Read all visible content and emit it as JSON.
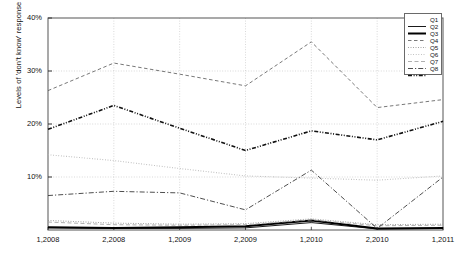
{
  "chart_data": {
    "type": "line",
    "title": "",
    "xlabel": "",
    "ylabel": "Levels of 'don't know' response",
    "categories": [
      "1,2008",
      "2,2008",
      "1,2009",
      "2,2009",
      "1,2010",
      "2,2010",
      "1,2011"
    ],
    "ylim": [
      0,
      40
    ],
    "yticks": [
      0,
      10,
      20,
      30,
      40
    ],
    "ytick_labels": [
      "",
      "10%",
      "20%",
      "30%",
      "40%"
    ],
    "grid": true,
    "legend_position": "top-right",
    "series": [
      {
        "name": "Q1",
        "style": "solid-thin",
        "color": "#000000",
        "values": [
          0.4,
          0.3,
          0.3,
          0.4,
          1.4,
          0.2,
          0.3
        ]
      },
      {
        "name": "Q2",
        "style": "solid-thick",
        "color": "#000000",
        "values": [
          0.5,
          0.4,
          0.5,
          0.7,
          1.8,
          0.3,
          0.4
        ]
      },
      {
        "name": "Q3",
        "style": "dashed",
        "color": "#555555",
        "values": [
          26.3,
          31.5,
          29.4,
          27.2,
          35.5,
          23.1,
          24.6
        ]
      },
      {
        "name": "Q4",
        "style": "dotted-fine",
        "color": "#8a8a8a",
        "values": [
          1.8,
          1.3,
          1.1,
          1.2,
          2.1,
          1.0,
          1.1
        ]
      },
      {
        "name": "Q5",
        "style": "dotted-light",
        "color": "#b5b5b5",
        "values": [
          14.2,
          13.1,
          11.6,
          10.2,
          9.8,
          9.4,
          10.2
        ]
      },
      {
        "name": "Q6",
        "style": "dashed-long",
        "color": "#9a9a9a",
        "values": [
          1.5,
          1.0,
          0.9,
          1.0,
          1.9,
          0.8,
          0.9
        ]
      },
      {
        "name": "Q7",
        "style": "dashdot",
        "color": "#3a3a3a",
        "values": [
          6.5,
          7.3,
          7.0,
          3.8,
          11.3,
          0.3,
          10.0
        ]
      },
      {
        "name": "Q8",
        "style": "dashdotdot",
        "color": "#111111",
        "values": [
          19.0,
          23.5,
          19.2,
          15.0,
          18.7,
          17.0,
          20.5
        ]
      }
    ]
  },
  "axis": {
    "y_tick_labels": [
      "40%",
      "30%",
      "20%",
      "10%"
    ],
    "x_tick_labels": [
      "1,2008",
      "2,2008",
      "1,2009",
      "2,2009",
      "1,2010",
      "2,2010",
      "1,2011"
    ],
    "y_axis_title": "Levels of 'don't know' response"
  },
  "legend": {
    "entries": [
      "Q1",
      "Q2",
      "Q3",
      "Q4",
      "Q5",
      "Q6",
      "Q7",
      "Q8"
    ]
  }
}
